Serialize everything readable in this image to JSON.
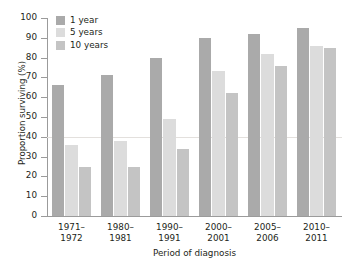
{
  "chart_data": {
    "type": "bar",
    "title": "",
    "subtitle": "",
    "xlabel": "Period of diagnosis",
    "ylabel": "Proportion surviving (%)",
    "ylim": [
      0,
      100
    ],
    "ytick_step": 10,
    "yticks": [
      "100",
      "90",
      "80",
      "70",
      "60",
      "50",
      "40",
      "30",
      "20",
      "10",
      "0"
    ],
    "grid": false,
    "reference_line": 40,
    "legend_position": "top-left",
    "categories": [
      "1971–\n1972",
      "1980–\n1981",
      "1990–\n1991",
      "2000–\n2001",
      "2005–\n2006",
      "2010–\n2011"
    ],
    "category_lines": [
      [
        "1971–",
        "1972"
      ],
      [
        "1980–",
        "1981"
      ],
      [
        "1990–",
        "1991"
      ],
      [
        "2000–",
        "2001"
      ],
      [
        "2005–",
        "2006"
      ],
      [
        "2010–",
        "2011"
      ]
    ],
    "series": [
      {
        "name": "1 year",
        "color": "#aaaaaa",
        "values": [
          66,
          71,
          80,
          90,
          92,
          95
        ]
      },
      {
        "name": "5 years",
        "color": "#dcdcdc",
        "values": [
          36,
          38,
          49,
          73,
          82,
          86
        ]
      },
      {
        "name": "10 years",
        "color": "#c4c4c4",
        "values": [
          25,
          25,
          34,
          62,
          76,
          85
        ]
      }
    ]
  },
  "legend": {
    "items": [
      {
        "label": "1 year",
        "color": "#aaaaaa"
      },
      {
        "label": "5 years",
        "color": "#dcdcdc"
      },
      {
        "label": "10 years",
        "color": "#c4c4c4"
      }
    ]
  },
  "axes": {
    "y_title": "Proportion surviving (%)",
    "x_title": "Period of diagnosis"
  }
}
